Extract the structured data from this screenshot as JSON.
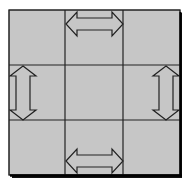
{
  "diagram": {
    "type": "3x3 grid with resize-handle arrows",
    "grid": {
      "rows": 3,
      "cols": 3,
      "cell_fill": "#c6c6c6",
      "line_color": "#222222",
      "shadow_color": "#111111"
    },
    "arrows": [
      {
        "id": "top",
        "orientation": "horizontal",
        "cell": "row1-col2",
        "glyph": "double-arrow-horizontal"
      },
      {
        "id": "bottom",
        "orientation": "horizontal",
        "cell": "row3-col2",
        "glyph": "double-arrow-horizontal"
      },
      {
        "id": "left",
        "orientation": "vertical",
        "cell": "row2-col1",
        "glyph": "double-arrow-vertical"
      },
      {
        "id": "right",
        "orientation": "vertical",
        "cell": "row2-col3",
        "glyph": "double-arrow-vertical"
      }
    ],
    "arrow_fill": "#c6c6c6",
    "arrow_stroke": "#222222"
  }
}
